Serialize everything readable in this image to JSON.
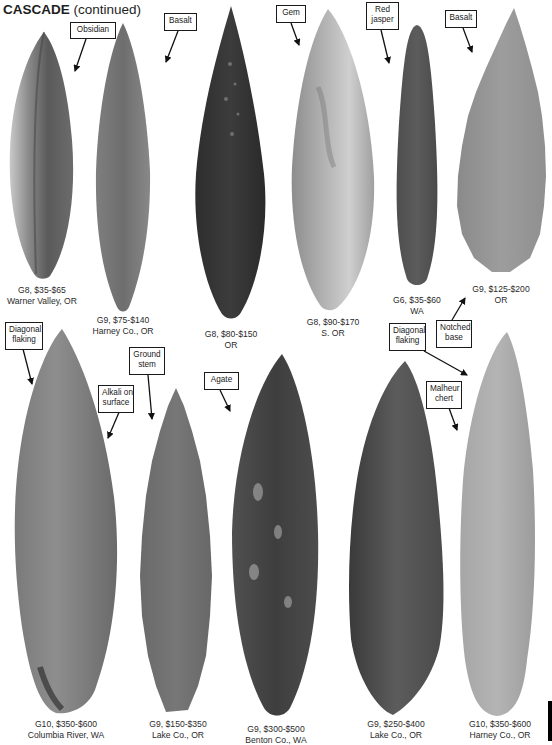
{
  "page": {
    "title_bold": "CASCADE",
    "title_rest": " (continued)"
  },
  "colors": {
    "background": "#ffffff",
    "text": "#222222",
    "callout_border": "#1a1a1a",
    "edge_tab": "#000000"
  },
  "top_row": [
    {
      "id": "obsidian-point",
      "material": "Obsidian",
      "grade_price": "G8, $35-$65",
      "location": "Warner Valley, OR"
    },
    {
      "id": "basalt-point-1",
      "material": "Basalt",
      "grade_price": "G9, $75-$140",
      "location": "Harney Co., OR"
    },
    {
      "id": "dark-point",
      "material": "",
      "grade_price": "G8, $80-$150",
      "location": "OR"
    },
    {
      "id": "gem-point",
      "material": "Gem",
      "grade_price": "G8, $90-$170",
      "location": "S. OR"
    },
    {
      "id": "red-jasper-point",
      "material": "Red jasper",
      "grade_price": "G6, $35-$60",
      "location": "WA"
    },
    {
      "id": "basalt-point-2",
      "material": "Basalt",
      "grade_price": "G9, $125-$200",
      "location": "OR"
    }
  ],
  "bottom_row": [
    {
      "id": "columbia-river-point",
      "grade_price": "G10, $350-$600",
      "location": "Columbia River, WA"
    },
    {
      "id": "ground-stem-point",
      "grade_price": "G9, $150-$350",
      "location": "Lake Co., OR"
    },
    {
      "id": "agate-point",
      "grade_price": "G9, $300-$500",
      "location": "Benton Co., WA"
    },
    {
      "id": "lake-co-point",
      "grade_price": "G9, $250-$400",
      "location": "Lake Co., OR"
    },
    {
      "id": "malheur-chert-point",
      "grade_price": "G10, $350-$600",
      "location": "Harney Co., OR"
    }
  ],
  "callouts": {
    "obsidian": [
      "Obsidian"
    ],
    "basalt_1": [
      "Basalt"
    ],
    "gem": [
      "Gem"
    ],
    "red_jasper": [
      "Red",
      "jasper"
    ],
    "basalt_2": [
      "Basalt"
    ],
    "notched_base": [
      "Notched",
      "base"
    ],
    "diagonal_flaking_left": [
      "Diagonal",
      "flaking"
    ],
    "alkali_on_surface": [
      "Alkali on",
      "surface"
    ],
    "ground_stem": [
      "Ground",
      "stem"
    ],
    "agate": [
      "Agate"
    ],
    "diagonal_flaking_right": [
      "Diagonal",
      "flaking"
    ],
    "malheur_chert": [
      "Malheur",
      "chert"
    ]
  }
}
